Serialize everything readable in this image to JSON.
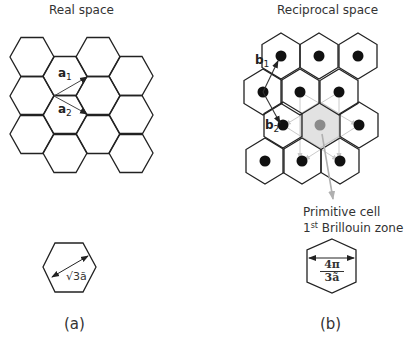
{
  "panels": {
    "real": {
      "title": "Real space",
      "caption": "(a)",
      "vectors": [
        {
          "name": "a",
          "sub": "1"
        },
        {
          "name": "a",
          "sub": "2"
        }
      ],
      "unit_cell_label": "√3ã"
    },
    "reciprocal": {
      "title": "Reciprocal space",
      "caption": "(b)",
      "vectors": [
        {
          "name": "b",
          "sub": "1"
        },
        {
          "name": "b",
          "sub": "2"
        }
      ],
      "callout_line1": "Primitive cell",
      "callout_line2_prefix": "1",
      "callout_line2_sup": "st",
      "callout_line2_suffix": " Brillouin zone",
      "cell_label_numerator": "4π",
      "cell_label_denominator": "3ã"
    }
  },
  "colors": {
    "line": "#222222",
    "dot": "#111111",
    "bz_fill": "#e2e2e2",
    "bz_stroke": "#c4c4c4",
    "center_dot": "#8a8a8a",
    "construction_lines": "#c8c8c8",
    "callout_arrow": "#b0b0b0"
  },
  "geometry": {
    "real_hex_centers": [
      [
        32,
        57
      ],
      [
        32,
        96
      ],
      [
        32,
        134
      ],
      [
        65,
        76
      ],
      [
        65,
        115
      ],
      [
        65,
        153
      ],
      [
        98,
        57
      ],
      [
        98,
        96
      ],
      [
        98,
        134
      ],
      [
        131,
        76
      ],
      [
        131,
        115
      ],
      [
        131,
        153
      ]
    ],
    "recip_hex_centers": [
      [
        281,
        56
      ],
      [
        319,
        56
      ],
      [
        358,
        56
      ],
      [
        263,
        92
      ],
      [
        300,
        92
      ],
      [
        339,
        92
      ],
      [
        283,
        125
      ],
      [
        359,
        125
      ],
      [
        265,
        161
      ],
      [
        302,
        161
      ],
      [
        340,
        161
      ]
    ],
    "recip_bz_center": [
      320,
      125
    ]
  }
}
